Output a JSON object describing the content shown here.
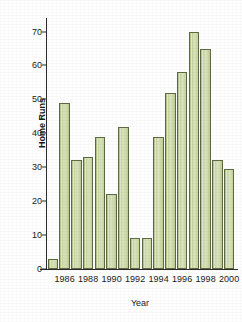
{
  "chart_data": {
    "type": "bar",
    "title": "",
    "xlabel": "Year",
    "ylabel": "Home Runs",
    "ylim": [
      0,
      74
    ],
    "ytick_values": [
      0,
      10,
      20,
      30,
      40,
      50,
      60,
      70
    ],
    "ytick_labels": [
      "0",
      "10",
      "20",
      "30",
      "40",
      "50",
      "60",
      "70"
    ],
    "xtick_labels": [
      "1986",
      "1988",
      "1990",
      "1992",
      "1994",
      "1996",
      "1998",
      "2000"
    ],
    "grid": false,
    "legend": "none",
    "bar_color": "#c8d69c",
    "bar_edge_color": "#5e6b42",
    "categories": [
      "1985",
      "1986",
      "1987",
      "1988",
      "1989",
      "1990",
      "1991",
      "1992",
      "1993",
      "1994",
      "1995",
      "1996",
      "1997",
      "1998",
      "1999",
      "2000"
    ],
    "values": [
      3,
      49,
      32,
      33,
      39,
      22,
      42,
      9,
      9,
      39,
      52,
      58,
      70,
      65,
      32,
      29.5
    ],
    "series": [
      {
        "name": "Home Runs",
        "values": [
          3,
          49,
          32,
          33,
          39,
          22,
          42,
          9,
          9,
          39,
          52,
          58,
          70,
          65,
          32,
          29.5
        ]
      }
    ]
  }
}
